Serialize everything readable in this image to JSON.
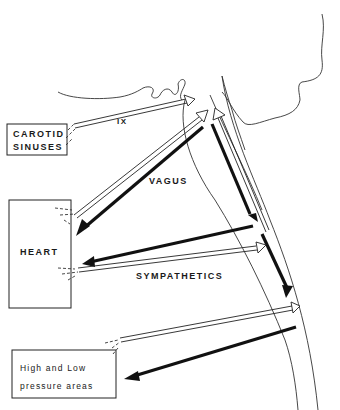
{
  "diagram": {
    "title": "",
    "boxes": {
      "carotid": {
        "line1": "CAROTID",
        "line2": "SINUSES"
      },
      "heart": {
        "label": "HEART"
      },
      "pressure": {
        "line1": "High and Low",
        "line2": "pressure areas"
      }
    },
    "nerve_labels": {
      "ix": "IX",
      "vagus": "VAGUS",
      "sympathetics": "SYMPATHETICS"
    },
    "legend": {
      "hollow_arrows": "afferent",
      "solid_arrows": "efferent"
    },
    "colors": {
      "ink": "#111111",
      "background": "#ffffff"
    }
  }
}
